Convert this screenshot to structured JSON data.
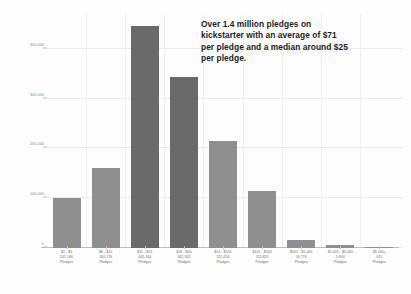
{
  "chart_data": {
    "type": "bar",
    "title": "",
    "subtitle": "",
    "xlabel": "",
    "ylabel": "",
    "grid": true,
    "legend": null,
    "ylim": [
      0,
      470000
    ],
    "yticks": [
      0,
      100000,
      200000,
      300000,
      400000
    ],
    "ytick_labels": [
      "0",
      "100,000",
      "200,000",
      "300,000",
      "400,000"
    ],
    "categories": [
      "$1 - $5",
      "$6 - $10",
      "$11 - $25",
      "$26 - $50",
      "$51 - $100",
      "$101 - $500",
      "$501 - $1,000",
      "$1,001 - $5,000",
      "$5,000+"
    ],
    "values": [
      101166,
      160176,
      445164,
      342942,
      215416,
      113852,
      16774,
      5904,
      615
    ],
    "value_labels": [
      "101,166",
      "160,176",
      "445,164",
      "342,942",
      "215,416",
      "113,852",
      "16,774",
      "5,904",
      "615"
    ],
    "bar_unit": "Pledges",
    "bar_colors": [
      "#8f8f8f",
      "#8f8f8f",
      "#6a6a6a",
      "#6a6a6a",
      "#8f8f8f",
      "#8f8f8f",
      "#8f8f8f",
      "#8f8f8f",
      "#8f8f8f"
    ],
    "annotation": [
      "Over 1.4 million pledges on",
      "kickstarter with an average of $71",
      "per pledge and a median around $25",
      "per pledge."
    ]
  },
  "colors": {
    "background": "#fdfdfd",
    "bar_light": "#8f8f8f",
    "bar_dark": "#6a6a6a",
    "grid": "#ececec",
    "axis": "#bdbdbd",
    "tick_text": "#7d7d7d",
    "annotation_text": "#1d1d1d"
  }
}
